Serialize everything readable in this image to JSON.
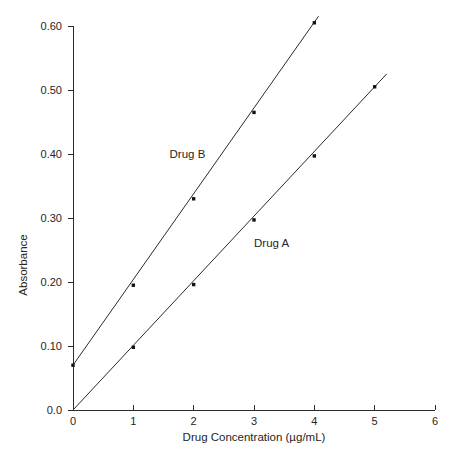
{
  "chart_data": {
    "type": "line",
    "title": "",
    "xlabel": "Drug Concentration (µg/mL)",
    "ylabel": "Absorbance",
    "xlim": [
      0,
      6
    ],
    "ylim": [
      0.0,
      0.6
    ],
    "grid": false,
    "legend_position": "inline-annotation",
    "x_ticks": [
      0,
      1,
      2,
      3,
      4,
      5,
      6
    ],
    "x_tick_labels": [
      "0",
      "1",
      "2",
      "3",
      "4",
      "5",
      "6"
    ],
    "y_ticks": [
      0.0,
      0.1,
      0.2,
      0.3,
      0.4,
      0.5,
      0.6
    ],
    "y_tick_labels": [
      "0.0",
      "0.10",
      "0.20",
      "0.30",
      "0.40",
      "0.50",
      "0.60"
    ],
    "series": [
      {
        "name": "Drug A",
        "color": "#2b2b2b",
        "x": [
          0,
          1,
          2,
          3,
          4,
          5
        ],
        "values": [
          0.0,
          0.098,
          0.196,
          0.297,
          0.397,
          0.505
        ],
        "line_x_start": 0,
        "line_x_end": 5.2,
        "intercept": 0.0,
        "slope": 0.101,
        "label_x": 3.0,
        "label_y": 0.255
      },
      {
        "name": "Drug B",
        "color": "#2b2b2b",
        "x": [
          0,
          1,
          2,
          3,
          4
        ],
        "values": [
          0.07,
          0.195,
          0.33,
          0.465,
          0.605
        ],
        "line_x_start": 0,
        "line_x_end": 4.07,
        "intercept": 0.07,
        "slope": 0.134,
        "label_x": 1.6,
        "label_y": 0.393
      }
    ],
    "annotations": [
      {
        "text": "Drug B",
        "x": 1.6,
        "y": 0.393
      },
      {
        "text": "Drug A",
        "x": 3.0,
        "y": 0.255
      }
    ]
  },
  "figure": {
    "background_color": "#ffffff",
    "axis_color": "#2b2b2b",
    "text_color": "#262626"
  }
}
